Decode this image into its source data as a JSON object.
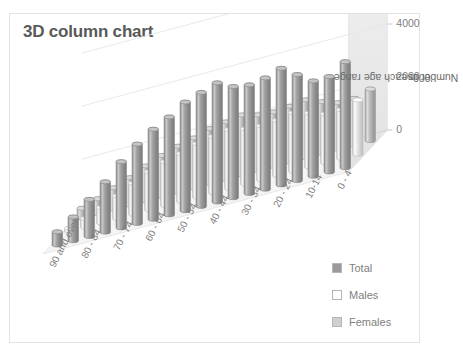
{
  "chart": {
    "title": "3D column chart",
    "border_color": "#e3e3e3",
    "background": "#ffffff",
    "title_color": "#595959"
  },
  "y_axis": {
    "title_line1": "Number in each age range",
    "title_line2": "'000s",
    "ticks": [
      "6000",
      "4000",
      "2000",
      "0"
    ]
  },
  "x_axis": {
    "visible_labels": [
      "90 and over",
      "80 - 84",
      "70 - 74",
      "60 - 64",
      "50 - 54",
      "40 - 44",
      "30 - 34",
      "20 - 24",
      "10-14",
      "0 - 4"
    ]
  },
  "legend": {
    "items": [
      {
        "label": "Total",
        "color": "#9b9b9b"
      },
      {
        "label": "Males",
        "color": "#ffffff"
      },
      {
        "label": "Females",
        "color": "#cfcfcf"
      }
    ]
  },
  "chart_data": {
    "type": "bar",
    "title": "3D column chart",
    "xlabel": "",
    "ylabel": "Number in each age range '000s",
    "ylim": [
      0,
      6000
    ],
    "yticks": [
      0,
      2000,
      4000,
      6000
    ],
    "grid": true,
    "legend_position": "right-bottom",
    "three_d": true,
    "shape": "cylinder",
    "categories": [
      "90 and over",
      "85 - 89",
      "80 - 84",
      "75 - 79",
      "70 - 74",
      "65 - 69",
      "60 - 64",
      "55 - 59",
      "50 - 54",
      "45 - 49",
      "40 - 44",
      "35 - 39",
      "30 - 34",
      "25 - 29",
      "20 - 24",
      "15 - 19",
      "10-14",
      "5 - 9",
      "0 - 4"
    ],
    "series": [
      {
        "name": "Total",
        "values": [
          500,
          900,
          1400,
          1900,
          2500,
          3000,
          3400,
          3700,
          4100,
          4300,
          4500,
          4200,
          4100,
          4200,
          4400,
          4000,
          3600,
          3600,
          4000
        ]
      },
      {
        "name": "Males",
        "values": [
          130,
          330,
          580,
          860,
          1180,
          1450,
          1660,
          1810,
          2020,
          2130,
          2230,
          2090,
          2040,
          2090,
          2210,
          2040,
          1840,
          1840,
          2050
        ]
      },
      {
        "name": "Females",
        "values": [
          370,
          570,
          820,
          1040,
          1320,
          1550,
          1740,
          1890,
          2080,
          2170,
          2270,
          2110,
          2060,
          2110,
          2190,
          1960,
          1760,
          1760,
          1950
        ]
      }
    ]
  }
}
